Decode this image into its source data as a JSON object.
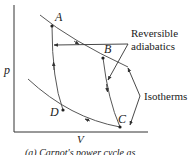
{
  "diagram": {
    "axes": {
      "y_label": "p",
      "x_label": "V"
    },
    "states": [
      {
        "id": "A",
        "label": "A"
      },
      {
        "id": "B",
        "label": "B"
      },
      {
        "id": "C",
        "label": "C"
      },
      {
        "id": "D",
        "label": "D"
      }
    ],
    "annotations": {
      "adiabatics_line1": "Reversible",
      "adiabatics_line2": "adiabatics",
      "isotherms": "Isotherms"
    },
    "caption": "(a) Carnot's power cycle as",
    "colors": {
      "line": "#333333",
      "text": "#222222",
      "background": "#ffffff"
    }
  }
}
